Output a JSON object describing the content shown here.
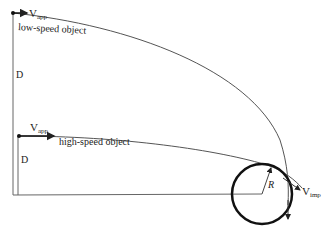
{
  "diagram": {
    "low_speed": {
      "velocity_label": "V",
      "velocity_sub": "app",
      "object_label": "low-speed object",
      "distance_label": "D"
    },
    "high_speed": {
      "velocity_label": "V",
      "velocity_sub": "app",
      "object_label": "high-speed object",
      "distance_label": "D"
    },
    "target": {
      "radius_label": "R",
      "impact_label": "V",
      "impact_sub": "imp"
    },
    "colors": {
      "line": "#555555",
      "circle": "#111111",
      "background": "#ffffff"
    }
  }
}
